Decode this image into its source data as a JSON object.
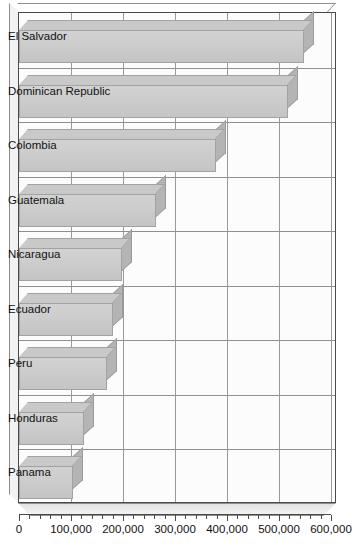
{
  "chart_data": {
    "type": "bar",
    "orientation": "horizontal",
    "style": "3d",
    "title": "",
    "subtitle": "",
    "xlabel": "",
    "ylabel": "",
    "categories": [
      "El Salvador",
      "Dominican Republic",
      "Colombia",
      "Guatemala",
      "Nicaragua",
      "Ecuador",
      "Peru",
      "Honduras",
      "Panama"
    ],
    "values": [
      548000,
      517000,
      378000,
      263000,
      199000,
      181000,
      170000,
      125000,
      104000
    ],
    "xlim": [
      0,
      600000
    ],
    "ylim": null,
    "grid": true,
    "legend": null,
    "annotations": [],
    "x_tick_labels": [
      "0",
      "100,000",
      "200,000",
      "300,000",
      "400,000",
      "500,000",
      "600,000"
    ],
    "x_tick_values": [
      0,
      100000,
      200000,
      300000,
      400000,
      500000,
      600000
    ],
    "x_minor_tick_interval": 20000,
    "bar_color": "#cdcdcd",
    "bar_top_color": "#c9c9c9",
    "bar_side_color": "#b4b4b4",
    "bar_edge_color": "#a2a2a2",
    "grid_color": "#9a9a9a",
    "axis_color": "#4a4a4a",
    "plot_background": "#fcfcfc",
    "text_color": "#111111"
  }
}
